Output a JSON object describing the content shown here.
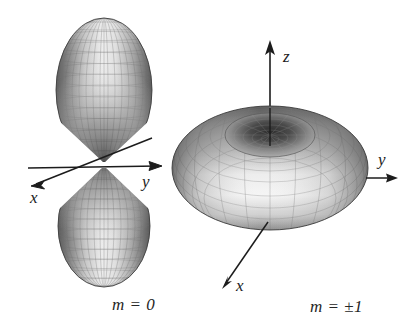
{
  "figure": {
    "background_color": "#ffffff",
    "ink_color": "#1c1c1c",
    "surface_light": "#f2f2f2",
    "surface_mid": "#a8a8a8",
    "surface_dark": "#4a4a4a",
    "mesh_color": "#6b6b6b"
  },
  "panels": [
    {
      "id": "left",
      "caption": "m = 0",
      "shape": "dumbbell",
      "description": "two vertically stacked lobes (ellipsoids) meeting at the origin",
      "axes": [
        {
          "name": "x",
          "label": "x",
          "direction": "down-left"
        },
        {
          "name": "y",
          "label": "y",
          "direction": "right"
        }
      ]
    },
    {
      "id": "right",
      "caption": "m = ±1",
      "shape": "torus",
      "description": "doughnut shaped surface of revolution about the z axis",
      "axes": [
        {
          "name": "z",
          "label": "z",
          "direction": "up"
        },
        {
          "name": "y",
          "label": "y",
          "direction": "right"
        },
        {
          "name": "x",
          "label": "x",
          "direction": "down-left"
        }
      ]
    }
  ],
  "captions": {
    "left": "m = 0",
    "right": "m = ±1"
  },
  "axis_labels": {
    "left_x": "x",
    "left_y": "y",
    "right_x": "x",
    "right_y": "y",
    "right_z": "z"
  }
}
